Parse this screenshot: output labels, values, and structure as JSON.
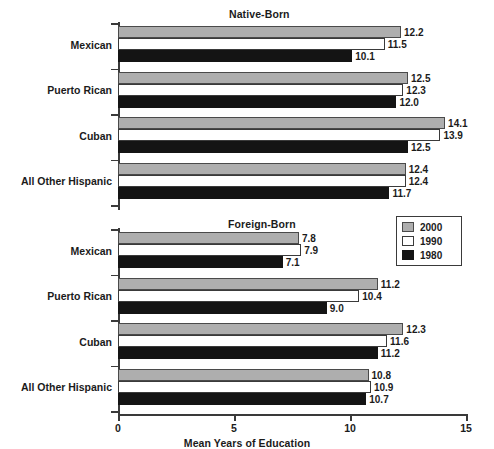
{
  "chart_data": {
    "type": "bar",
    "orientation": "horizontal",
    "title": "",
    "xlabel": "Mean Years of Education",
    "ylabel": "",
    "xlim": [
      0,
      15
    ],
    "xticks": [
      "0",
      "5",
      "10",
      "15"
    ],
    "xtick_values": [
      0,
      5,
      10,
      15
    ],
    "grid": false,
    "legend_position": "upper-right-middle",
    "legend": [
      "2000",
      "1990",
      "1980"
    ],
    "series": [
      {
        "name": "2000",
        "color": "#aeaeae"
      },
      {
        "name": "1990",
        "color": "#ffffff"
      },
      {
        "name": "1980",
        "color": "#141414"
      }
    ],
    "panels": [
      {
        "title": "Native-Born",
        "categories": [
          "Mexican",
          "Puerto Rican",
          "Cuban",
          "All Other Hispanic"
        ],
        "series": [
          {
            "name": "2000",
            "values": [
              12.2,
              12.5,
              14.1,
              12.4
            ]
          },
          {
            "name": "1990",
            "values": [
              11.5,
              12.3,
              13.9,
              12.4
            ]
          },
          {
            "name": "1980",
            "values": [
              10.1,
              12.0,
              12.5,
              11.7
            ]
          }
        ]
      },
      {
        "title": "Foreign-Born",
        "categories": [
          "Mexican",
          "Puerto Rican",
          "Cuban",
          "All Other Hispanic"
        ],
        "series": [
          {
            "name": "2000",
            "values": [
              7.8,
              11.2,
              12.3,
              10.8
            ]
          },
          {
            "name": "1990",
            "values": [
              7.9,
              10.4,
              11.6,
              10.9
            ]
          },
          {
            "name": "1980",
            "values": [
              7.1,
              9.0,
              11.2,
              10.7
            ]
          }
        ]
      }
    ]
  },
  "labels": {
    "native_title": "Native-Born",
    "foreign_title": "Foreign-Born",
    "xaxis_title": "Mean Years of Education"
  }
}
